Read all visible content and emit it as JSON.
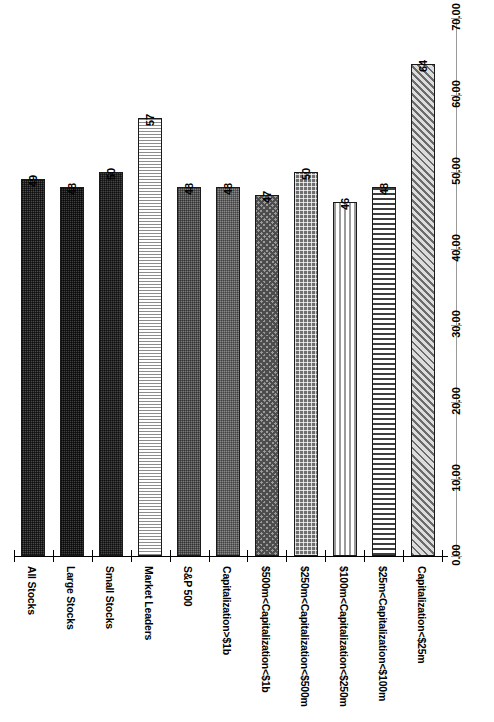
{
  "chart_data": {
    "type": "bar",
    "title": "",
    "subtitle": "",
    "xlabel": "",
    "ylabel": "",
    "orientation": "vertical-bars-rotated-page",
    "grid": false,
    "legend": "none",
    "ylim": [
      0.0,
      70.0
    ],
    "ytick_labels": [
      "0.00",
      "10.00",
      "20.00",
      "30.00",
      "40.00",
      "50.00",
      "60.00",
      "70.00"
    ],
    "ytick_values": [
      0,
      10,
      20,
      30,
      40,
      50,
      60,
      70
    ],
    "categories": [
      "All Stocks",
      "Large Stocks",
      "Small Stocks",
      "Market Leaders",
      "S&P 500",
      "Capitalization>$1b",
      "$500m<Capitalization<$1b",
      "$250m<Capitalization<$500m",
      "$100m<Capitalization<$250m",
      "$25m<Capitalization<$100m",
      "Capitalization<$25m"
    ],
    "values": [
      49,
      48,
      50,
      57,
      48,
      48,
      47,
      50,
      46,
      48,
      64
    ],
    "data_labels": [
      "49",
      "48",
      "50",
      "57",
      "48",
      "48",
      "47",
      "50",
      "46",
      "48",
      "64"
    ],
    "bar_patterns": [
      "dark-dotted",
      "dark-dotted",
      "dark-dotted",
      "light-horizontal-stripes",
      "mid-gray-dotted",
      "fine-dotted",
      "checkerboard-crosshatch",
      "coarse-dotted",
      "vertical-stripes",
      "horizontal-stripes",
      "diagonal-hatch"
    ],
    "colors": {
      "bar_outline": "#1a1a1a",
      "axis": "#9a9a9a",
      "baseline": "#000000",
      "background": "#ffffff",
      "text": "#000000"
    }
  }
}
